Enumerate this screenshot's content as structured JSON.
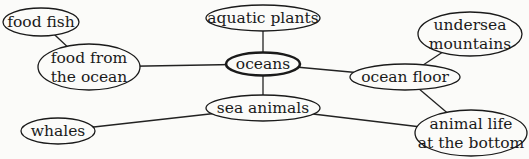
{
  "diagram": {
    "type": "concept-map",
    "central_node": "oceans",
    "nodes": [
      {
        "id": "food_fish",
        "lines": [
          "food fish"
        ]
      },
      {
        "id": "food_from_ocean",
        "lines": [
          "food from",
          "the ocean"
        ]
      },
      {
        "id": "aquatic_plants",
        "lines": [
          "aquatic plants"
        ]
      },
      {
        "id": "oceans",
        "lines": [
          "oceans"
        ],
        "central": true
      },
      {
        "id": "undersea_mountains",
        "lines": [
          "undersea",
          "mountains"
        ]
      },
      {
        "id": "ocean_floor",
        "lines": [
          "ocean floor"
        ]
      },
      {
        "id": "sea_animals",
        "lines": [
          "sea animals"
        ]
      },
      {
        "id": "whales",
        "lines": [
          "whales"
        ]
      },
      {
        "id": "animal_life_bottom",
        "lines": [
          "animal life",
          "at the bottom"
        ]
      }
    ],
    "edges": [
      {
        "from": "oceans",
        "to": "aquatic_plants"
      },
      {
        "from": "oceans",
        "to": "food_from_ocean"
      },
      {
        "from": "oceans",
        "to": "ocean_floor"
      },
      {
        "from": "oceans",
        "to": "sea_animals"
      },
      {
        "from": "food_from_ocean",
        "to": "food_fish"
      },
      {
        "from": "ocean_floor",
        "to": "undersea_mountains"
      },
      {
        "from": "ocean_floor",
        "to": "animal_life_bottom"
      },
      {
        "from": "sea_animals",
        "to": "whales"
      },
      {
        "from": "sea_animals",
        "to": "animal_life_bottom"
      }
    ]
  }
}
